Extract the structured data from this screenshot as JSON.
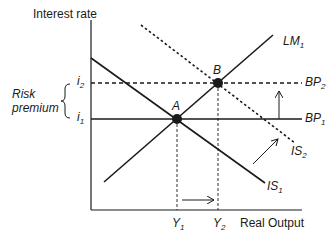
{
  "diagram": {
    "type": "IS-LM-BP",
    "axes": {
      "y_label": "Interest rate",
      "x_label": "Real Output"
    },
    "y_ticks": [
      {
        "base": "i",
        "sub": "2"
      },
      {
        "base": "i",
        "sub": "1"
      }
    ],
    "x_ticks": [
      {
        "base": "Y",
        "sub": "1"
      },
      {
        "base": "Y",
        "sub": "2"
      }
    ],
    "curves": {
      "lm1": {
        "base": "LM",
        "sub": "1",
        "style": "solid"
      },
      "is1": {
        "base": "IS",
        "sub": "1",
        "style": "solid"
      },
      "is2": {
        "base": "IS",
        "sub": "2",
        "style": "dotted"
      },
      "bp1": {
        "base": "BP",
        "sub": "1",
        "style": "solid"
      },
      "bp2": {
        "base": "BP",
        "sub": "2",
        "style": "dashed"
      }
    },
    "points": {
      "a": "A",
      "b": "B"
    },
    "annotation": {
      "line1": "Risk",
      "line2": "premium"
    },
    "colors": {
      "line": "#1a1a1a",
      "background": "#ffffff"
    }
  }
}
